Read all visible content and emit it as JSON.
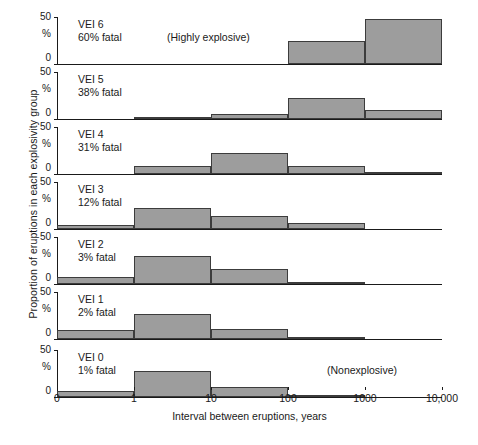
{
  "chart_data": {
    "type": "bar",
    "title": "",
    "subtitle": "",
    "xlabel": "Interval between eruptions, years",
    "ylabel": "Proportion of eruptions in each explosivity group",
    "grid": false,
    "legend": null,
    "ylim": [
      0,
      50
    ],
    "ytick_labels": [
      "50",
      "%",
      "0"
    ],
    "yunit": "%",
    "xtick_labels": [
      "0",
      "1",
      "10",
      "100",
      "1000",
      "10,000"
    ],
    "bins": [
      "0-1",
      "1-10",
      "10-100",
      "100-1000",
      "1000-10,000"
    ],
    "annotations": [
      {
        "panel": "VEI 6",
        "text": "(Highly explosive)"
      },
      {
        "panel": "VEI 0",
        "text": "(Nonexplosive)"
      }
    ],
    "panels": [
      {
        "name": "VEI 6",
        "fatal": "60% fatal",
        "note": "(Highly explosive)",
        "values": [
          0,
          0,
          0,
          25,
          48
        ]
      },
      {
        "name": "VEI 5",
        "fatal": "38% fatal",
        "note": "",
        "values": [
          0,
          2,
          5,
          22,
          10
        ]
      },
      {
        "name": "VEI 4",
        "fatal": "31% fatal",
        "note": "",
        "values": [
          0,
          8,
          22,
          8,
          1
        ]
      },
      {
        "name": "VEI 3",
        "fatal": "12% fatal",
        "note": "",
        "values": [
          4,
          22,
          14,
          6,
          0
        ]
      },
      {
        "name": "VEI 2",
        "fatal": "3% fatal",
        "note": "",
        "values": [
          7,
          30,
          16,
          2,
          0
        ]
      },
      {
        "name": "VEI 1",
        "fatal": "2% fatal",
        "note": "",
        "values": [
          10,
          27,
          11,
          1,
          0
        ]
      },
      {
        "name": "VEI 0",
        "fatal": "1% fatal",
        "note": "(Nonexplosive)",
        "values": [
          6,
          28,
          11,
          1,
          0
        ]
      }
    ],
    "colors": {
      "bar_fill": "#9d9d9d",
      "bar_stroke": "#3c3c3c",
      "axis": "#1a1a1a",
      "background": "#ffffff"
    }
  }
}
